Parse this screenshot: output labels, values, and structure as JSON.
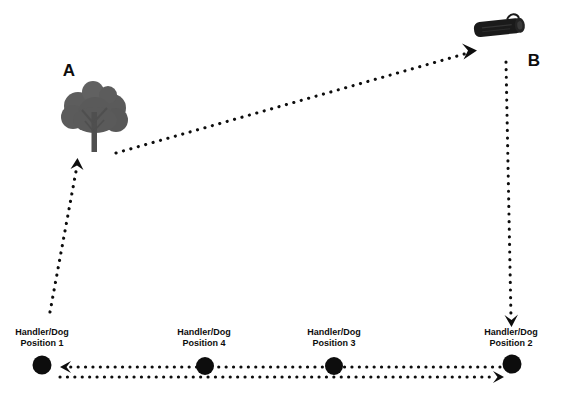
{
  "diagram": {
    "title_letters": [
      {
        "id": "A",
        "text": "A",
        "x": 69,
        "y": 76
      },
      {
        "id": "B",
        "text": "B",
        "x": 534,
        "y": 66
      }
    ],
    "objects": [
      {
        "name": "tree",
        "label": "A",
        "color": "#595959",
        "x": 95,
        "y": 118
      },
      {
        "name": "log",
        "label": "B",
        "color": "#1a1a1a",
        "x": 499,
        "y": 28
      }
    ],
    "positions": [
      {
        "id": 1,
        "line1": "Handler/Dog",
        "line2": "Position 1",
        "cx": 42,
        "cy": 365,
        "label_x": 42,
        "label_y": 338
      },
      {
        "id": 4,
        "line1": "Handler/Dog",
        "line2": "Position 4",
        "cx": 205,
        "cy": 366,
        "label_x": 204,
        "label_y": 338
      },
      {
        "id": 3,
        "line1": "Handler/Dog",
        "line2": "Position 3",
        "cx": 334,
        "cy": 366,
        "label_x": 334,
        "label_y": 338
      },
      {
        "id": 2,
        "line1": "Handler/Dog",
        "line2": "Position 2",
        "cx": 512,
        "cy": 364,
        "label_x": 511,
        "label_y": 338
      }
    ],
    "paths": [
      {
        "name": "position1-to-tree",
        "from": "Handler/Dog Position 1",
        "to": "A",
        "direction": "up"
      },
      {
        "name": "tree-to-log",
        "from": "A",
        "to": "B",
        "direction": "up-right"
      },
      {
        "name": "log-to-position2",
        "from": "B",
        "to": "Handler/Dog Position 2",
        "direction": "down"
      },
      {
        "name": "position2-to-position1",
        "from": "Handler/Dog Position 2",
        "to": "Handler/Dog Position 1",
        "direction": "left"
      },
      {
        "name": "position1-to-position2",
        "from": "Handler/Dog Position 1",
        "to": "Handler/Dog Position 2",
        "direction": "right"
      }
    ],
    "colors": {
      "ink": "#0d0d0d",
      "tree": "#595959",
      "log": "#1a1a1a",
      "background": "#ffffff"
    }
  }
}
